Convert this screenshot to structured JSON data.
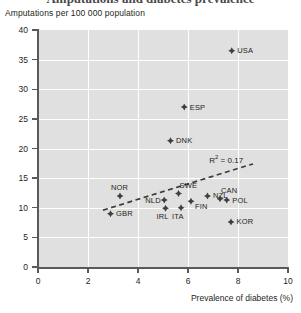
{
  "title_partial": "Amputations and diabetes prevalence",
  "chart_data": {
    "type": "scatter",
    "title": "",
    "xlabel": "Prevalence of diabetes (%)",
    "ylabel": "Amputations per 100 000 population",
    "xlim": [
      0,
      10
    ],
    "ylim": [
      0,
      40
    ],
    "xticks": [
      "0",
      "2",
      "4",
      "6",
      "8",
      "10"
    ],
    "xtick_values": [
      0,
      2,
      4,
      6,
      8,
      10
    ],
    "yticks": [
      "0",
      "5",
      "10",
      "15",
      "20",
      "25",
      "30",
      "35",
      "40"
    ],
    "ytick_values": [
      0,
      5,
      10,
      15,
      20,
      25,
      30,
      35,
      40
    ],
    "grid": true,
    "legend_position": "none",
    "annotation": "R² = 0.17",
    "annotation_r2_value": 0.17,
    "trendline": {
      "style": "dashed",
      "x_start": 2.6,
      "y_start": 9.6,
      "x_end": 8.6,
      "y_end": 17.4
    },
    "points": [
      {
        "label": "USA",
        "x": 7.75,
        "y": 36.5,
        "label_pos": "right"
      },
      {
        "label": "ESP",
        "x": 5.85,
        "y": 27.0,
        "label_pos": "right"
      },
      {
        "label": "DNK",
        "x": 5.3,
        "y": 21.3,
        "label_pos": "right"
      },
      {
        "label": "SWE",
        "x": 5.62,
        "y": 12.4,
        "label_pos": "above-right"
      },
      {
        "label": "NOR",
        "x": 3.28,
        "y": 12.0,
        "label_pos": "above"
      },
      {
        "label": "NZL",
        "x": 6.78,
        "y": 12.0,
        "label_pos": "right"
      },
      {
        "label": "CAN",
        "x": 7.28,
        "y": 11.5,
        "label_pos": "above-right"
      },
      {
        "label": "POL",
        "x": 7.55,
        "y": 11.3,
        "label_pos": "right"
      },
      {
        "label": "NLD",
        "x": 5.05,
        "y": 11.3,
        "label_pos": "left"
      },
      {
        "label": "FIN",
        "x": 6.12,
        "y": 11.1,
        "label_pos": "below-right"
      },
      {
        "label": "ITA",
        "x": 5.72,
        "y": 10.0,
        "label_pos": "below"
      },
      {
        "label": "IRL",
        "x": 5.1,
        "y": 9.9,
        "label_pos": "below"
      },
      {
        "label": "GBR",
        "x": 2.9,
        "y": 9.0,
        "label_pos": "right"
      },
      {
        "label": "KOR",
        "x": 7.72,
        "y": 7.6,
        "label_pos": "right"
      }
    ]
  }
}
